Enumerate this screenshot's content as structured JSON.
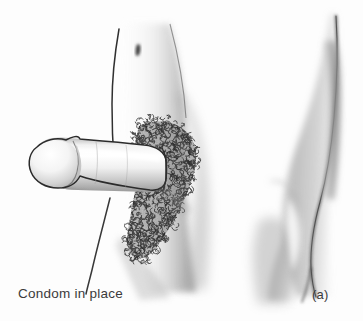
{
  "figure": {
    "kind": "anatomical-line-illustration",
    "medium": "pen-and-ink with graphite shading",
    "background_color": "#fdfdfd",
    "ink_color": "#2b2b2b",
    "shading_color": "#8d8d8d",
    "text_color": "#3b3b3b",
    "width": 363,
    "height": 321
  },
  "labels": {
    "caption": "Condom in place",
    "panel_letter": "(a)"
  },
  "panels": [
    {
      "id": "left-panel",
      "name": "detailed-figure",
      "description": "Three-quarter view of lower torso with condom-sheathed phallus directed left, dense pubic hair texture, navel mark above",
      "parts": [
        "torso-contour",
        "navel-mark",
        "condom-sheath",
        "glans-tip",
        "pubic-hair-texture",
        "thigh-contour"
      ]
    },
    {
      "id": "right-panel",
      "name": "silhouette-figure",
      "description": "Simplified soft-shaded profile silhouette of torso and thigh with no outline detail",
      "parts": [
        "profile-contour",
        "soft-shadow-mass"
      ]
    }
  ]
}
